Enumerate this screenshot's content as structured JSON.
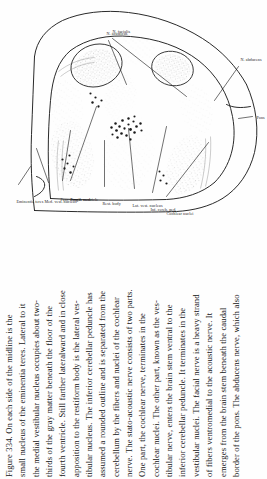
{
  "page": {
    "background_color": "#fefefe",
    "ink_color": "#161616",
    "orientation": "rotated-90-ccw"
  },
  "figure": {
    "name": "brain-stem-cross-section-plate",
    "labels": [
      "Eminentia teres",
      "Med. vest. nucleus",
      "Fasc. longit. med.",
      "Fourth ventricle",
      "Rest. body",
      "Lat. vest. nucleus",
      "Inf. cereb. ped.",
      "Cochlear nuclei",
      "N. acusticus",
      "N. facialis",
      "N. abducens",
      "Pons"
    ],
    "leader_line_color": "#2a2a2a",
    "stipple_color": "#333333"
  },
  "caption": {
    "figure_number": "Figure 334.",
    "lines": [
      "Figure 334.    On each side of the midline is the",
      "small nucleus of the eminentia teres. Lateral to it",
      "the medial vestibular nucleus occupies about two-",
      "thirds of the gray matter beneath the floor of the",
      "fourth ventricle. Still farther lateralward and in close",
      "apposition to the restiform body is the lateral ves-",
      "tibular nucleus. The inferior cerebellar peduncle has",
      "assumed a rounded outline and is separated from the",
      "cerebellum by the fibers and nuclei of the cochlear",
      "nerve. The stato-acoustic nerve consists of two parts.",
      "One part, the cochlear nerve, terminates in the",
      "cochlear nuclei. The other part, known as the ves-",
      "tibular nerve, enters the brain stem ventral to the",
      "inferior cerebellar peduncle. It terminates in the",
      "vestibular nuclei. The facial nerve is a heavy strand",
      "of fibers ventromedial to the acoustic nerve. It",
      "emerges from the brain stem beneath the caudal",
      "border of the pons. The abducens nerve, which also"
    ],
    "line_count": 18
  }
}
